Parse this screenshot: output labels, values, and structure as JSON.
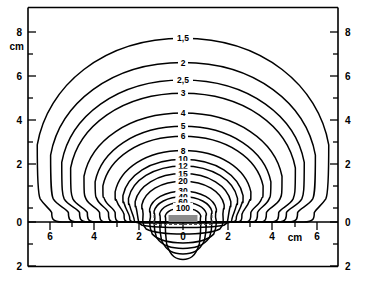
{
  "figure": {
    "title": "",
    "source_label": "R/h",
    "background_color": "#ffffff",
    "line_color": "#000000",
    "source_bar_color": "#8c8c8c"
  },
  "axes": {
    "unit_label": "cm",
    "left": {
      "name": "left-axis",
      "unit": "cm",
      "major_ticks": [
        "8",
        "6",
        "4",
        "2",
        "0",
        "2"
      ],
      "major_values": [
        8,
        6,
        4,
        2,
        0,
        -2
      ],
      "minor_values": [
        7,
        5,
        3,
        1,
        -1
      ]
    },
    "right": {
      "name": "right-axis",
      "major_ticks": [
        "8",
        "6",
        "4",
        "2",
        "0",
        "2"
      ],
      "major_values": [
        8,
        6,
        4,
        2,
        0,
        -2
      ],
      "minor_values": [
        7,
        5,
        3,
        1,
        -1
      ]
    },
    "bottom": {
      "name": "bottom-axis",
      "unit": "cm",
      "major_ticks": [
        "6",
        "4",
        "2",
        "0",
        "2",
        "4",
        "6"
      ],
      "major_values": [
        -6,
        -4,
        -2,
        0,
        2,
        4,
        6
      ],
      "minor_values": [
        -5,
        -3,
        -1,
        1,
        3,
        5
      ]
    }
  },
  "chart_data": {
    "type": "line",
    "subtype": "contour",
    "title": "",
    "xlabel": "cm",
    "ylabel": "cm",
    "xlim": [
      -7,
      7
    ],
    "ylim": [
      -2,
      9
    ],
    "grid": false,
    "legend": "none",
    "annotations": [
      "R/h"
    ],
    "value_unit": "R/h",
    "contour_levels": [
      "1,5",
      "2",
      "2,5",
      "3",
      "4",
      "5",
      "6",
      "8",
      "10",
      "12",
      "15",
      "20",
      "30",
      "40",
      "60",
      "100"
    ],
    "contour_values": [
      1.5,
      2,
      2.5,
      3,
      4,
      5,
      6,
      8,
      10,
      12,
      15,
      20,
      30,
      40,
      60,
      100
    ],
    "label_x": 0,
    "contours": [
      {
        "level": "1,5",
        "apex_y": 8.35,
        "half_width": 6.55,
        "foot_x": 5.9,
        "below_depth": 0.0
      },
      {
        "level": "2",
        "apex_y": 7.25,
        "half_width": 5.95,
        "foot_x": 5.15,
        "below_depth": 0.0
      },
      {
        "level": "2,5",
        "apex_y": 6.45,
        "half_width": 5.45,
        "foot_x": 4.65,
        "below_depth": 0.0
      },
      {
        "level": "3",
        "apex_y": 5.85,
        "half_width": 5.05,
        "foot_x": 4.3,
        "below_depth": 0.0
      },
      {
        "level": "4",
        "apex_y": 4.95,
        "half_width": 4.45,
        "foot_x": 3.75,
        "below_depth": 0.0
      },
      {
        "level": "5",
        "apex_y": 4.35,
        "half_width": 3.95,
        "foot_x": 3.35,
        "below_depth": 0.0
      },
      {
        "level": "6",
        "apex_y": 3.9,
        "half_width": 3.6,
        "foot_x": 3.05,
        "below_depth": 0.0
      },
      {
        "level": "8",
        "apex_y": 3.25,
        "half_width": 3.05,
        "foot_x": 2.65,
        "below_depth": 0.0
      },
      {
        "level": "10",
        "apex_y": 2.85,
        "half_width": 2.7,
        "foot_x": 2.4,
        "below_depth": 0.0
      },
      {
        "level": "12",
        "apex_y": 2.55,
        "half_width": 2.45,
        "foot_x": 2.2,
        "below_depth": 0.05
      },
      {
        "level": "15",
        "apex_y": 2.2,
        "half_width": 2.15,
        "foot_x": 2.0,
        "below_depth": 0.25
      },
      {
        "level": "20",
        "apex_y": 1.85,
        "half_width": 1.85,
        "foot_x": 1.8,
        "below_depth": 0.55
      },
      {
        "level": "30",
        "apex_y": 1.4,
        "half_width": 1.5,
        "foot_x": 1.5,
        "below_depth": 0.95
      },
      {
        "level": "40",
        "apex_y": 1.15,
        "half_width": 1.3,
        "foot_x": 1.3,
        "below_depth": 1.2
      },
      {
        "level": "60",
        "apex_y": 0.9,
        "half_width": 1.05,
        "foot_x": 1.05,
        "below_depth": 1.45
      },
      {
        "level": "100",
        "apex_y": 0.65,
        "half_width": 0.8,
        "foot_x": 0.8,
        "below_depth": 1.7
      }
    ],
    "source": {
      "label": "R/h",
      "x_start": -0.65,
      "x_end": 0.65,
      "y": 0,
      "style": "gray-bar-with-dashed-outline"
    }
  }
}
